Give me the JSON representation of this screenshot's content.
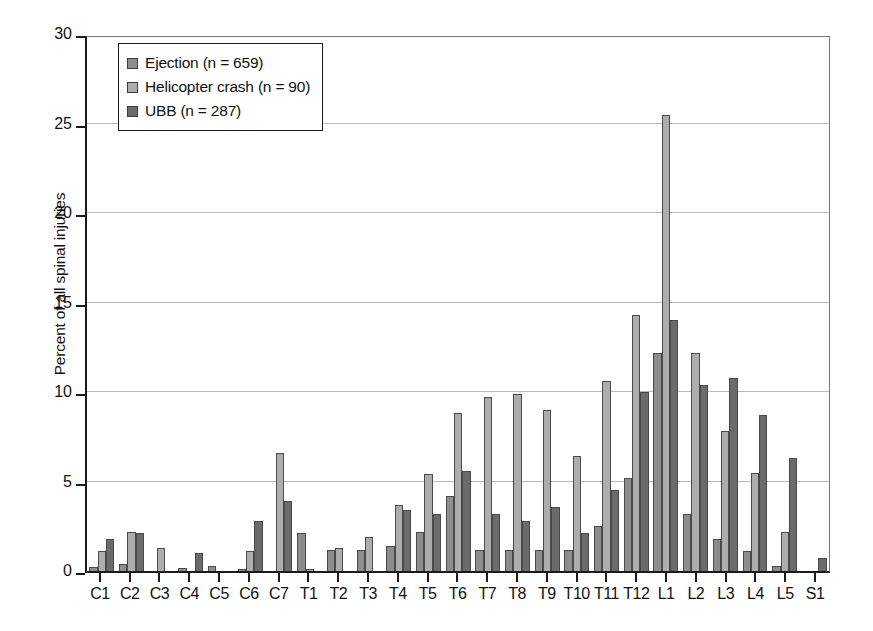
{
  "chart_data": {
    "type": "bar",
    "title": "",
    "xlabel": "",
    "ylabel": "Percent of all spinal injuries",
    "ylim": [
      0,
      30
    ],
    "ytick_values": [
      0,
      5,
      10,
      15,
      20,
      25,
      30
    ],
    "ytick_labels": [
      "0",
      "5",
      "10",
      "15",
      "20",
      "25",
      "30"
    ],
    "grid": true,
    "legend_position": "top-left",
    "categories": [
      "C1",
      "C2",
      "C3",
      "C4",
      "C5",
      "C6",
      "C7",
      "T1",
      "T2",
      "T3",
      "T4",
      "T5",
      "T6",
      "T7",
      "T8",
      "T9",
      "T10",
      "T11",
      "T12",
      "L1",
      "L2",
      "L3",
      "L4",
      "L5",
      "S1"
    ],
    "series": [
      {
        "name": "Ejection (n = 659)",
        "color": "#8d8d8d",
        "values": [
          0.2,
          0.4,
          0.0,
          0.15,
          0.3,
          0.1,
          0.0,
          2.1,
          1.2,
          1.2,
          1.4,
          2.2,
          4.2,
          1.2,
          1.2,
          1.2,
          1.2,
          2.5,
          5.2,
          12.2,
          3.2,
          1.8,
          1.1,
          0.3,
          0.0
        ]
      },
      {
        "name": "Helicopter crash (n = 90)",
        "color": "#adadad",
        "values": [
          1.1,
          2.2,
          1.3,
          0.0,
          0.0,
          1.1,
          6.6,
          0.1,
          1.3,
          1.9,
          3.7,
          5.4,
          8.8,
          9.7,
          9.9,
          9.0,
          6.4,
          10.6,
          14.3,
          25.5,
          12.2,
          7.8,
          5.5,
          2.2,
          0.0
        ]
      },
      {
        "name": "UBB (n = 287)",
        "color": "#6b6b6b",
        "values": [
          1.8,
          2.1,
          0.0,
          1.0,
          0.0,
          2.8,
          3.9,
          0.0,
          0.0,
          0.0,
          3.4,
          3.2,
          5.6,
          3.2,
          2.8,
          3.6,
          2.1,
          4.5,
          10.0,
          14.0,
          10.4,
          10.8,
          8.7,
          6.3,
          0.7
        ]
      }
    ]
  },
  "legend": {
    "items": [
      {
        "label": "Ejection (n = 659)"
      },
      {
        "label": "Helicopter crash (n = 90)"
      },
      {
        "label": "UBB (n = 287)"
      }
    ]
  }
}
